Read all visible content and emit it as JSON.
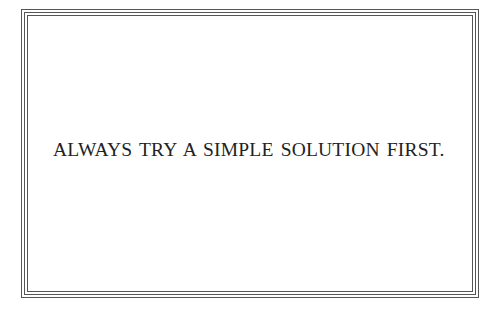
{
  "card": {
    "motto": "ALWAYS TRY A SIMPLE SOLUTION FIRST.",
    "border_color": "#555555",
    "text_color": "#222222",
    "background": "#ffffff",
    "border_lines": 3
  }
}
